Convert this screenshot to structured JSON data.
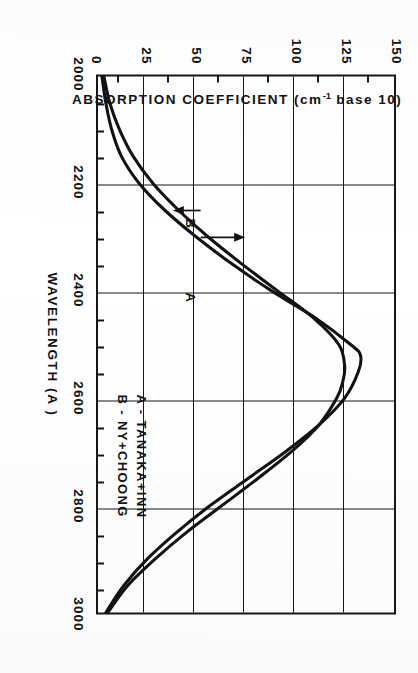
{
  "chart_data": {
    "type": "line",
    "title": "",
    "xlabel": "WAVELENGTH (A )",
    "ylabel_prefix": "ABSORPTION COEFFICIENT (cm",
    "ylabel_sup": "-1",
    "ylabel_suffix": " base 10)",
    "xlim": [
      2000,
      3000
    ],
    "ylim": [
      0,
      150
    ],
    "xticks": [
      "2000",
      "2200",
      "2400",
      "2600",
      "2800",
      "3000"
    ],
    "xtick_values": [
      2000,
      2200,
      2400,
      2600,
      2800,
      3000
    ],
    "yticks": [
      "0",
      "25",
      "50",
      "75",
      "100",
      "125",
      "150"
    ],
    "ytick_values": [
      0,
      25,
      50,
      75,
      100,
      125,
      150
    ],
    "grid": true,
    "legend_position": "lower-right",
    "series": [
      {
        "name": "A",
        "legend": "A -  TANAKA+INN",
        "x": [
          2000,
          2050,
          2100,
          2150,
          2200,
          2250,
          2300,
          2350,
          2400,
          2450,
          2500,
          2520,
          2550,
          2600,
          2650,
          2700,
          2750,
          2800,
          2850,
          2900,
          2950,
          3000
        ],
        "values": [
          2,
          4,
          7,
          12,
          21,
          34,
          50,
          68,
          88,
          110,
          128,
          133,
          132,
          125,
          112,
          95,
          76,
          57,
          40,
          25,
          13,
          4
        ]
      },
      {
        "name": "B",
        "legend": "B -  NY+CHOONG",
        "x": [
          2000,
          2050,
          2100,
          2150,
          2200,
          2250,
          2300,
          2350,
          2400,
          2450,
          2500,
          2540,
          2570,
          2600,
          2650,
          2700,
          2750,
          2800,
          2850,
          2900,
          2950,
          3000
        ],
        "values": [
          3,
          6,
          11,
          18,
          28,
          41,
          56,
          73,
          91,
          109,
          122,
          125,
          124,
          121,
          112,
          98,
          81,
          63,
          45,
          29,
          15,
          5
        ]
      }
    ],
    "annotations": [
      {
        "label": "A",
        "target_x": 2300,
        "target_y": 50
      },
      {
        "label": "B",
        "target_x": 2250,
        "target_y": 50
      }
    ]
  },
  "legend": {
    "line_a": "A -  TANAKA+INN",
    "line_b": "B -  NY+CHOONG"
  },
  "axes": {
    "x_title": "WAVELENGTH (A )",
    "y_title_pre": "ABSORPTION COEFFICIENT (cm",
    "y_title_sup": "-1",
    "y_title_post": " base 10)"
  },
  "annotations": {
    "a": "A",
    "b": "B"
  }
}
